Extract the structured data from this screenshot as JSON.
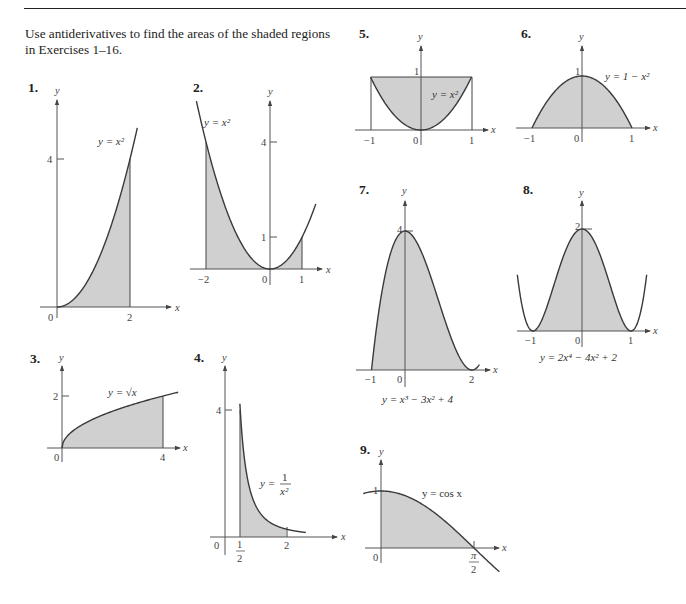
{
  "header": {
    "instructions": "Use antiderivatives to find the areas of the shaded regions in Exercises 1–16."
  },
  "colors": {
    "shade": "#d0d0d0",
    "curve": "#3a3a3a",
    "axis": "#555555",
    "text": "#222222"
  },
  "chart_data": [
    {
      "id": 1,
      "type": "area",
      "label": "1.",
      "function": "y = x^2",
      "equation_label": "y = x²",
      "shaded_interval": [
        0,
        2
      ],
      "x_ticks": [
        "0",
        "2"
      ],
      "y_ticks": [
        "4"
      ],
      "xlabel": "x",
      "ylabel": "y",
      "points": [
        [
          0,
          0
        ],
        [
          0.5,
          0.25
        ],
        [
          1,
          1
        ],
        [
          1.5,
          2.25
        ],
        [
          2,
          4
        ],
        [
          2.2,
          4.84
        ]
      ]
    },
    {
      "id": 2,
      "type": "area",
      "label": "2.",
      "function": "y = x^2",
      "equation_label": "y = x²",
      "shaded_interval": [
        -2,
        1
      ],
      "x_ticks": [
        "−2",
        "0",
        "1"
      ],
      "y_ticks": [
        "4",
        "1"
      ],
      "xlabel": "x",
      "ylabel": "y",
      "points": [
        [
          -2.3,
          5.29
        ],
        [
          -2,
          4
        ],
        [
          -1,
          1
        ],
        [
          0,
          0
        ],
        [
          1,
          1
        ],
        [
          1.4,
          1.96
        ]
      ]
    },
    {
      "id": 3,
      "type": "area",
      "label": "3.",
      "function": "y = sqrt(x)",
      "equation_label": "y = √x",
      "shaded_interval": [
        0,
        4
      ],
      "x_ticks": [
        "0",
        "4"
      ],
      "y_ticks": [
        "2"
      ],
      "xlabel": "x",
      "ylabel": "y",
      "points": [
        [
          0,
          0
        ],
        [
          1,
          1
        ],
        [
          2,
          1.414
        ],
        [
          3,
          1.732
        ],
        [
          4,
          2
        ],
        [
          4.5,
          2.12
        ]
      ]
    },
    {
      "id": 4,
      "type": "area",
      "label": "4.",
      "function": "y = 1/x^2",
      "equation_label": "y = 1/x²",
      "shaded_interval": [
        0.5,
        2
      ],
      "x_ticks": [
        "0",
        "1/2",
        "2"
      ],
      "y_ticks": [
        "4"
      ],
      "xlabel": "x",
      "ylabel": "y",
      "points": [
        [
          0.5,
          4
        ],
        [
          1,
          1
        ],
        [
          1.5,
          0.444
        ],
        [
          2,
          0.25
        ],
        [
          2.6,
          0.148
        ]
      ]
    },
    {
      "id": 5,
      "type": "area",
      "label": "5.",
      "function": "region between y = 1 and y = x^2",
      "equation_label": "y = x²",
      "shaded_interval": [
        -1,
        1
      ],
      "x_ticks": [
        "−1",
        "0",
        "1"
      ],
      "y_ticks": [
        "1"
      ],
      "xlabel": "x",
      "ylabel": "y",
      "points": [
        [
          -1,
          1
        ],
        [
          -0.5,
          0.25
        ],
        [
          0,
          0
        ],
        [
          0.5,
          0.25
        ],
        [
          1,
          1
        ]
      ]
    },
    {
      "id": 6,
      "type": "area",
      "label": "6.",
      "function": "y = 1 - x^2",
      "equation_label": "y = 1 − x²",
      "shaded_interval": [
        -1,
        1
      ],
      "x_ticks": [
        "−1",
        "0",
        "1"
      ],
      "y_ticks": [
        "1"
      ],
      "xlabel": "x",
      "ylabel": "y",
      "points": [
        [
          -1,
          0
        ],
        [
          -0.5,
          0.75
        ],
        [
          0,
          1
        ],
        [
          0.5,
          0.75
        ],
        [
          1,
          0
        ]
      ]
    },
    {
      "id": 7,
      "type": "area",
      "label": "7.",
      "function": "y = x^3 - 3x^2 + 4",
      "equation_label": "y = x³ − 3x² + 4",
      "shaded_interval": [
        -1,
        2
      ],
      "x_ticks": [
        "−1",
        "0",
        "2"
      ],
      "y_ticks": [
        "4"
      ],
      "xlabel": "x",
      "ylabel": "y",
      "points": [
        [
          -1,
          0
        ],
        [
          -0.5,
          3.125
        ],
        [
          0,
          4
        ],
        [
          0.5,
          3.375
        ],
        [
          1,
          2
        ],
        [
          1.5,
          0.625
        ],
        [
          2,
          0
        ],
        [
          2.2,
          0.128
        ]
      ]
    },
    {
      "id": 8,
      "type": "area",
      "label": "8.",
      "function": "y = 2x^4 - 4x^2 + 2",
      "equation_label": "y = 2x⁴ − 4x² + 2",
      "shaded_interval": [
        -1,
        1
      ],
      "x_ticks": [
        "−1",
        "0",
        "1"
      ],
      "y_ticks": [
        "2"
      ],
      "xlabel": "x",
      "ylabel": "y",
      "points": [
        [
          -1.3,
          0.569
        ],
        [
          -1,
          0
        ],
        [
          -0.5,
          1.125
        ],
        [
          0,
          2
        ],
        [
          0.5,
          1.125
        ],
        [
          1,
          0
        ],
        [
          1.3,
          0.569
        ]
      ]
    },
    {
      "id": 9,
      "type": "area",
      "label": "9.",
      "function": "y = cos x",
      "equation_label": "y = cos x",
      "shaded_interval": [
        0,
        1.5708
      ],
      "x_ticks": [
        "0",
        "π/2"
      ],
      "y_ticks": [
        "1"
      ],
      "xlabel": "x",
      "ylabel": "y",
      "points": [
        [
          -0.3,
          0.955
        ],
        [
          0,
          1
        ],
        [
          0.785,
          0.707
        ],
        [
          1.5708,
          0
        ],
        [
          2.0,
          -0.416
        ]
      ]
    }
  ]
}
